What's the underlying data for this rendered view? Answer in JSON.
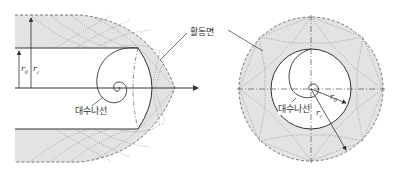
{
  "diagram": {
    "left_figure": {
      "labels": {
        "spiral": "대수나선",
        "active_surface": "활동면",
        "r0": "r",
        "r0_sub": "0",
        "rc": "r",
        "rc_sub": "c"
      }
    },
    "right_figure": {
      "labels": {
        "spiral": "대수나선",
        "r0": "r",
        "r0_sub": "0",
        "rc": "r",
        "rc_sub": "c"
      }
    },
    "colors": {
      "shade": "#e3e3e3",
      "line": "#333333",
      "dotted": "#666666"
    }
  }
}
